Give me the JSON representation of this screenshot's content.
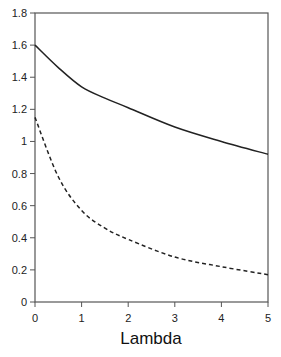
{
  "chart_data": {
    "type": "line",
    "title": "",
    "xlabel": "Lambda",
    "ylabel": "",
    "xlim": [
      0,
      5
    ],
    "ylim": [
      0,
      1.8
    ],
    "grid": false,
    "legend": null,
    "x_ticks": [
      "0",
      "1",
      "2",
      "3",
      "4",
      "5"
    ],
    "y_ticks": [
      "0",
      "0.2",
      "0.4",
      "0.6",
      "0.8",
      "1",
      "1.2",
      "1.4",
      "1.6",
      "1.8"
    ],
    "x": [
      0,
      0.5,
      1,
      1.5,
      2,
      3,
      4,
      5
    ],
    "series": [
      {
        "name": "solid",
        "style": "solid",
        "values": [
          1.6,
          1.46,
          1.34,
          1.27,
          1.21,
          1.09,
          1.0,
          0.92
        ]
      },
      {
        "name": "dashed",
        "style": "dashed",
        "values": [
          1.15,
          0.78,
          0.57,
          0.46,
          0.39,
          0.28,
          0.22,
          0.17
        ]
      }
    ]
  }
}
